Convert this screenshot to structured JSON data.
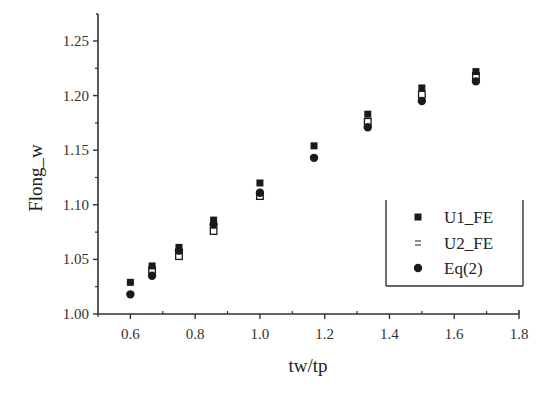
{
  "chart_data": {
    "type": "scatter",
    "title": "",
    "xlabel": "tw/tp",
    "ylabel": "Flong_w",
    "xlim": [
      0.5,
      1.8
    ],
    "ylim": [
      1.0,
      1.27
    ],
    "x_ticks": [
      0.6,
      0.8,
      1.0,
      1.2,
      1.4,
      1.6,
      1.8
    ],
    "x_tick_labels": [
      "0.6",
      "0.8",
      "1.0",
      "1.2",
      "1.4",
      "1.6",
      "1.8"
    ],
    "y_ticks": [
      1.0,
      1.05,
      1.1,
      1.15,
      1.2,
      1.25
    ],
    "y_tick_labels": [
      "1.00",
      "1.05",
      "1.10",
      "1.15",
      "1.20",
      "1.25"
    ],
    "grid": false,
    "legend_position": "lower right",
    "series": [
      {
        "name": "U1_FE",
        "marker": "filled-square",
        "color": "#1a1a1a",
        "x": [
          0.6,
          0.667,
          0.75,
          0.857,
          1.0,
          1.167,
          1.333,
          1.5,
          1.667
        ],
        "y": [
          1.029,
          1.044,
          1.061,
          1.086,
          1.12,
          1.154,
          1.183,
          1.207,
          1.222
        ]
      },
      {
        "name": "U2_FE",
        "marker": "open-square",
        "color": "#1a1a1a",
        "x": [
          0.667,
          0.75,
          0.857,
          1.0,
          1.333,
          1.5,
          1.667
        ],
        "y": [
          1.04,
          1.053,
          1.076,
          1.108,
          1.176,
          1.201,
          1.218
        ]
      },
      {
        "name": "Eq(2)",
        "marker": "filled-circle",
        "color": "#1a1a1a",
        "x": [
          0.6,
          0.667,
          0.75,
          0.857,
          1.0,
          1.167,
          1.333,
          1.5,
          1.667
        ],
        "y": [
          1.018,
          1.035,
          1.058,
          1.082,
          1.111,
          1.143,
          1.171,
          1.195,
          1.213
        ]
      }
    ]
  },
  "legend": {
    "items": [
      {
        "label": "U1_FE"
      },
      {
        "label": "U2_FE"
      },
      {
        "label": "Eq(2)"
      }
    ]
  }
}
